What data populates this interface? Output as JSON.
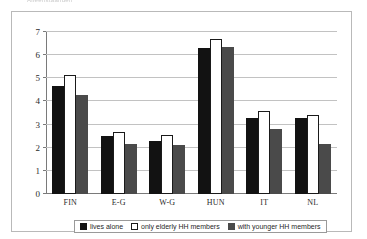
{
  "top_caption": "Alleenstaanden",
  "chart_data": {
    "type": "bar",
    "title": "",
    "subtitle": "",
    "xlabel": "",
    "ylabel": "",
    "categories": [
      "FIN",
      "E-G",
      "W-G",
      "HUN",
      "IT",
      "NL"
    ],
    "series": [
      {
        "name": "lives alone",
        "color": "#121212",
        "values": [
          4.65,
          2.5,
          2.28,
          6.3,
          3.3,
          3.28
        ]
      },
      {
        "name": "only elderly HH members",
        "color": "#ffffff",
        "values": [
          5.15,
          2.7,
          2.55,
          6.7,
          3.58,
          3.42
        ]
      },
      {
        "name": "with younger HH members",
        "color": "#4a4a4a",
        "values": [
          4.28,
          2.15,
          2.1,
          6.35,
          2.8,
          2.15
        ]
      }
    ],
    "ylim": [
      0,
      7
    ],
    "yticks": [
      0,
      1,
      2,
      3,
      4,
      5,
      6,
      7
    ],
    "ytick_labels": [
      "0",
      "1",
      "2",
      "3",
      "4",
      "5",
      "6",
      "7"
    ],
    "grid": true,
    "legend_position": "bottom"
  },
  "legend": {
    "items": [
      {
        "label": "lives alone"
      },
      {
        "label": "only elderly HH members"
      },
      {
        "label": "with younger HH members"
      }
    ]
  }
}
